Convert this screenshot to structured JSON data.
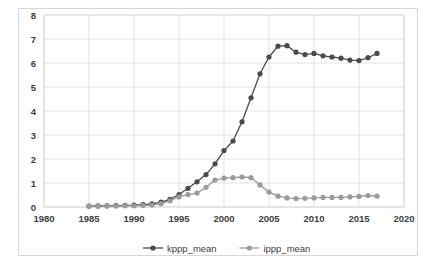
{
  "chart_data": {
    "type": "line",
    "title": "",
    "xlabel": "",
    "ylabel": "",
    "xlim": [
      1980,
      2020
    ],
    "ylim": [
      0,
      8
    ],
    "xticks": [
      1980,
      1985,
      1990,
      1995,
      2000,
      2005,
      2010,
      2015,
      2020
    ],
    "yticks": [
      0,
      1,
      2,
      3,
      4,
      5,
      6,
      7,
      8
    ],
    "grid": true,
    "legend_position": "bottom",
    "markers": "circle",
    "x": [
      1985,
      1986,
      1987,
      1988,
      1989,
      1990,
      1991,
      1992,
      1993,
      1994,
      1995,
      1996,
      1997,
      1998,
      1999,
      2000,
      2001,
      2002,
      2003,
      2004,
      2005,
      2006,
      2007,
      2008,
      2009,
      2010,
      2011,
      2012,
      2013,
      2014,
      2015,
      2016,
      2017
    ],
    "series": [
      {
        "name": "kppp_mean",
        "color": "#4a4a4a",
        "values": [
          0.04,
          0.05,
          0.05,
          0.06,
          0.07,
          0.08,
          0.1,
          0.13,
          0.2,
          0.32,
          0.52,
          0.78,
          1.05,
          1.35,
          1.8,
          2.35,
          2.75,
          3.55,
          4.55,
          5.55,
          6.25,
          6.7,
          6.72,
          6.45,
          6.35,
          6.4,
          6.3,
          6.25,
          6.2,
          6.12,
          6.1,
          6.22,
          6.4
        ]
      },
      {
        "name": "ippp_mean",
        "color": "#9b9b9b",
        "values": [
          0.03,
          0.03,
          0.04,
          0.04,
          0.05,
          0.05,
          0.06,
          0.08,
          0.14,
          0.26,
          0.42,
          0.52,
          0.58,
          0.82,
          1.12,
          1.2,
          1.22,
          1.25,
          1.22,
          0.92,
          0.62,
          0.45,
          0.38,
          0.35,
          0.36,
          0.38,
          0.4,
          0.4,
          0.4,
          0.42,
          0.44,
          0.48,
          0.45
        ]
      }
    ],
    "legend": [
      {
        "label": "kppp_mean",
        "color": "#4a4a4a"
      },
      {
        "label": "ippp_mean",
        "color": "#9b9b9b"
      }
    ]
  }
}
